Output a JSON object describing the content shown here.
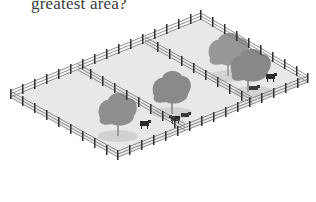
{
  "question": {
    "text": "greatest area?"
  },
  "illustration": {
    "description": "Isometric fenced field divided into three rectangular pens with trees and cows",
    "pens": [
      {
        "id": "left-pen",
        "trees": 1,
        "cows": 1
      },
      {
        "id": "middle-pen",
        "trees": 1,
        "cows": 2
      },
      {
        "id": "right-pen",
        "trees": 2,
        "cows": 2
      }
    ],
    "colors": {
      "ground": "#e6e6e6",
      "fence_rail": "#6a6a6a",
      "fence_post": "#2f2f2f",
      "tree": "#8c8c8c",
      "tree_shadow": "#cfcfcf",
      "cow": "#2a2a2a"
    }
  }
}
